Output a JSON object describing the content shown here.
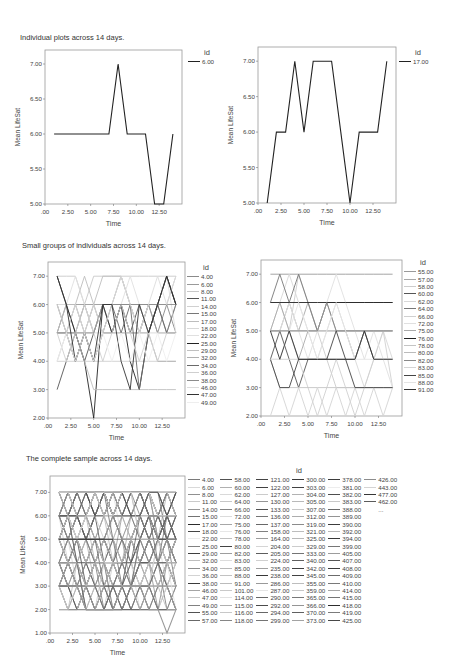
{
  "sections": {
    "individual_title": "Individual plots across 14 days.",
    "small_groups_title": "Small groups of individuals across 14 days.",
    "complete_title": "The complete sample across 14 days."
  },
  "legend_title": "id",
  "chart_data": [
    {
      "type": "line",
      "title": "Individual plots across 14 days.",
      "xlabel": "Time",
      "ylabel": "Mean LifeSat",
      "xlim": [
        0,
        15
      ],
      "ylim": [
        5,
        7.2
      ],
      "xticks": [
        ".00",
        "2.50",
        "5.00",
        "7.50",
        "10.00",
        "12.50"
      ],
      "yticks": [
        "5.00",
        "5.50",
        "6.00",
        "6.50",
        "7.00"
      ],
      "legend_title": "id",
      "legend_position": "right",
      "x": [
        1,
        2,
        3,
        4,
        5,
        6,
        7,
        8,
        9,
        10,
        11,
        12,
        13,
        14
      ],
      "series": [
        {
          "name": "6.00",
          "color": "#222222",
          "values": [
            6,
            6,
            6,
            6,
            6,
            6,
            6,
            7,
            6,
            6,
            6,
            5,
            5,
            6
          ]
        }
      ]
    },
    {
      "type": "line",
      "xlabel": "Time",
      "ylabel": "Mean LifeSat",
      "xlim": [
        0,
        15
      ],
      "ylim": [
        5,
        7.2
      ],
      "xticks": [
        ".00",
        "2.50",
        "5.00",
        "7.50",
        "10.00",
        "12.50"
      ],
      "yticks": [
        "5.00",
        "5.50",
        "6.00",
        "6.50",
        "7.00"
      ],
      "legend_title": "id",
      "legend_position": "right",
      "x": [
        1,
        2,
        3,
        4,
        5,
        6,
        7,
        8,
        9,
        10,
        11,
        12,
        13,
        14
      ],
      "series": [
        {
          "name": "17.00",
          "color": "#222222",
          "values": [
            5,
            6,
            6,
            7,
            6,
            7,
            7,
            7,
            6,
            5,
            6,
            6,
            6,
            7
          ]
        }
      ]
    },
    {
      "type": "line",
      "title": "Small groups of individuals across 14 days.",
      "xlabel": "Time",
      "ylabel": "Mean LifeSat",
      "xlim": [
        0,
        15
      ],
      "ylim": [
        2,
        7.5
      ],
      "xticks": [
        ".00",
        "2.50",
        "5.00",
        "7.50",
        "10.00",
        "12.50"
      ],
      "yticks": [
        "2.00",
        "3.00",
        "4.00",
        "5.00",
        "6.00",
        "7.00"
      ],
      "legend_title": "id",
      "legend_position": "right",
      "x": [
        1,
        2,
        3,
        4,
        5,
        6,
        7,
        8,
        9,
        10,
        11,
        12,
        13,
        14
      ],
      "series": [
        {
          "name": "4.00",
          "color": "#8a8a8a",
          "values": [
            5,
            5,
            6,
            5,
            6,
            5,
            5,
            6,
            5,
            5,
            6,
            5,
            6,
            5
          ]
        },
        {
          "name": "6.00",
          "color": "#9a9a9a",
          "values": [
            6,
            6,
            6,
            6,
            6,
            6,
            6,
            7,
            6,
            6,
            6,
            5,
            5,
            6
          ]
        },
        {
          "name": "8.00",
          "color": "#c8c8c8",
          "values": [
            7,
            7,
            7,
            6,
            7,
            7,
            7,
            7,
            7,
            7,
            7,
            7,
            7,
            7
          ]
        },
        {
          "name": "11.00",
          "color": "#555555",
          "values": [
            3,
            4,
            5,
            4,
            5,
            6,
            5,
            6,
            5,
            6,
            5,
            6,
            7,
            6
          ]
        },
        {
          "name": "14.00",
          "color": "#d0d0d0",
          "values": [
            4,
            4,
            4,
            4,
            4,
            4,
            4,
            4,
            4,
            4,
            4,
            4,
            4,
            4
          ]
        },
        {
          "name": "15.00",
          "color": "#777777",
          "values": [
            5,
            6,
            5,
            6,
            5,
            6,
            6,
            6,
            6,
            5,
            6,
            6,
            5,
            6
          ]
        },
        {
          "name": "17.00",
          "color": "#bdbdbd",
          "values": [
            5,
            6,
            6,
            7,
            6,
            7,
            7,
            7,
            6,
            5,
            6,
            6,
            6,
            7
          ]
        },
        {
          "name": "18.00",
          "color": "#d8d8d8",
          "values": [
            5,
            5,
            5,
            5,
            5,
            5,
            5,
            5,
            5,
            5,
            5,
            5,
            5,
            5
          ]
        },
        {
          "name": "22.00",
          "color": "#e0e0e0",
          "values": [
            6,
            6,
            7,
            6,
            5,
            6,
            5,
            6,
            7,
            6,
            5,
            6,
            7,
            5
          ]
        },
        {
          "name": "25.00",
          "color": "#222222",
          "values": [
            7,
            6,
            5,
            4,
            2,
            6,
            5,
            6,
            4,
            3,
            5,
            6,
            7,
            6
          ]
        },
        {
          "name": "29.00",
          "color": "#c0c0c0",
          "values": [
            4,
            5,
            5,
            4,
            3,
            3,
            3,
            3,
            3,
            3,
            3,
            3,
            3,
            3
          ]
        },
        {
          "name": "32.00",
          "color": "#b0b0b0",
          "values": [
            5,
            5,
            4,
            5,
            4,
            5,
            5,
            5,
            5,
            5,
            5,
            4,
            4,
            4
          ]
        },
        {
          "name": "34.00",
          "color": "#6a6a6a",
          "values": [
            6,
            5,
            4,
            5,
            4,
            5,
            6,
            5,
            6,
            3,
            5,
            6,
            5,
            5
          ]
        },
        {
          "name": "36.00",
          "color": "#cfcfcf",
          "values": [
            5,
            4,
            5,
            6,
            5,
            4,
            5,
            6,
            5,
            4,
            5,
            4,
            5,
            5
          ]
        },
        {
          "name": "38.00",
          "color": "#8c8c8c",
          "values": [
            5,
            5,
            5,
            5,
            5,
            6,
            6,
            6,
            6,
            6,
            6,
            6,
            6,
            6
          ]
        },
        {
          "name": "46.00",
          "color": "#dcdcdc",
          "values": [
            6,
            5,
            6,
            5,
            6,
            5,
            6,
            7,
            6,
            5,
            6,
            7,
            6,
            7
          ]
        },
        {
          "name": "47.00",
          "color": "#333333",
          "values": [
            7,
            6,
            4,
            5,
            4,
            6,
            6,
            4,
            3,
            6,
            5,
            6,
            7,
            6
          ]
        },
        {
          "name": "49.00",
          "color": "#eeeeee",
          "values": [
            4,
            5,
            4,
            5,
            4,
            5,
            4,
            5,
            4,
            5,
            4,
            5,
            4,
            5
          ]
        }
      ]
    },
    {
      "type": "line",
      "xlabel": "Time",
      "ylabel": "Mean LifeSat",
      "xlim": [
        0,
        15
      ],
      "ylim": [
        2,
        7.5
      ],
      "xticks": [
        ".00",
        "2.50",
        "5.00",
        "7.50",
        "10.00",
        "12.50"
      ],
      "yticks": [
        "2.00",
        "3.00",
        "4.00",
        "5.00",
        "6.00",
        "7.00"
      ],
      "legend_title": "id",
      "legend_position": "right",
      "x": [
        1,
        2,
        3,
        4,
        5,
        6,
        7,
        8,
        9,
        10,
        11,
        12,
        13,
        14
      ],
      "series": [
        {
          "name": "55.00",
          "color": "#9a9a9a",
          "values": [
            7,
            7,
            7,
            7,
            7,
            7,
            7,
            7,
            7,
            7,
            7,
            7,
            7,
            7
          ]
        },
        {
          "name": "57.00",
          "color": "#a8a8a8",
          "values": [
            5,
            5,
            6,
            5,
            6,
            5,
            5,
            5,
            5,
            5,
            5,
            5,
            5,
            5
          ]
        },
        {
          "name": "58.00",
          "color": "#cccccc",
          "values": [
            6,
            6,
            5,
            7,
            6,
            5,
            4,
            3,
            3,
            3,
            3,
            3,
            3,
            3
          ]
        },
        {
          "name": "60.00",
          "color": "#555555",
          "values": [
            4,
            5,
            4,
            3,
            4,
            4,
            4,
            4,
            4,
            4,
            5,
            4,
            4,
            4
          ]
        },
        {
          "name": "62.00",
          "color": "#d8d8d8",
          "values": [
            5,
            6,
            7,
            6,
            5,
            4,
            5,
            6,
            5,
            4,
            3,
            4,
            5,
            4
          ]
        },
        {
          "name": "64.00",
          "color": "#777777",
          "values": [
            6,
            7,
            6,
            7,
            6,
            5,
            6,
            6,
            6,
            6,
            6,
            6,
            6,
            6
          ]
        },
        {
          "name": "66.00",
          "color": "#d0d0d0",
          "values": [
            4,
            4,
            4,
            4,
            3,
            2,
            3,
            4,
            3,
            2,
            3,
            4,
            5,
            3
          ]
        },
        {
          "name": "72.00",
          "color": "#e0e0e0",
          "values": [
            5,
            5,
            6,
            5,
            4,
            5,
            6,
            7,
            6,
            5,
            4,
            5,
            4,
            3
          ]
        },
        {
          "name": "75.00",
          "color": "#aaaaaa",
          "values": [
            5,
            6,
            5,
            4,
            5,
            5,
            6,
            5,
            5,
            5,
            5,
            5,
            5,
            5
          ]
        },
        {
          "name": "76.00",
          "color": "#222222",
          "values": [
            6,
            6,
            6,
            6,
            6,
            6,
            6,
            6,
            6,
            6,
            6,
            6,
            6,
            6
          ]
        },
        {
          "name": "78.00",
          "color": "#c4c4c4",
          "values": [
            4,
            3,
            3,
            3,
            3,
            3,
            3,
            3,
            3,
            3,
            3,
            3,
            3,
            3
          ]
        },
        {
          "name": "80.00",
          "color": "#bbbbbb",
          "values": [
            5,
            5,
            5,
            5,
            5,
            5,
            5,
            5,
            5,
            4,
            5,
            5,
            5,
            5
          ]
        },
        {
          "name": "82.00",
          "color": "#888888",
          "values": [
            5,
            5,
            5,
            5,
            5,
            5,
            6,
            5,
            5,
            5,
            5,
            5,
            5,
            5
          ]
        },
        {
          "name": "83.00",
          "color": "#d4d4d4",
          "values": [
            2,
            3,
            2,
            3,
            2,
            3,
            2,
            3,
            2,
            3,
            2,
            3,
            2,
            3
          ]
        },
        {
          "name": "85.00",
          "color": "#444444",
          "values": [
            4,
            3,
            3,
            4,
            4,
            4,
            4,
            5,
            4,
            3,
            3,
            3,
            3,
            3
          ]
        },
        {
          "name": "88.00",
          "color": "#e4e4e4",
          "values": [
            4,
            4,
            5,
            6,
            5,
            4,
            5,
            6,
            5,
            4,
            4,
            4,
            4,
            4
          ]
        },
        {
          "name": "91.00",
          "color": "#333333",
          "values": [
            5,
            4,
            5,
            4,
            4,
            4,
            4,
            4,
            4,
            4,
            5,
            4,
            4,
            4
          ]
        }
      ]
    },
    {
      "type": "line",
      "title": "The complete sample across 14 days.",
      "xlabel": "Time",
      "ylabel": "Mean LifeSat",
      "xlim": [
        0,
        15
      ],
      "ylim": [
        1,
        7.7
      ],
      "xticks": [
        ".00",
        "2.50",
        "5.00",
        "7.50",
        "10.00",
        "12.50"
      ],
      "yticks": [
        "1.00",
        "2.00",
        "3.00",
        "4.00",
        "5.00",
        "6.00",
        "7.00"
      ],
      "legend_title": "id",
      "legend_position": "right",
      "x": [
        1,
        2,
        3,
        4,
        5,
        6,
        7,
        8,
        9,
        10,
        11,
        12,
        13,
        14
      ],
      "series_note": "Dense overlay of all ids listed in legend_columns; lines generated procedurally in gray shades",
      "legend_columns": [
        [
          "4.00",
          "6.00",
          "8.00",
          "11.00",
          "14.00",
          "15.00",
          "17.00",
          "18.00",
          "22.00",
          "25.00",
          "29.00",
          "32.00",
          "34.00",
          "36.00",
          "38.00",
          "46.00",
          "47.00",
          "49.00",
          "55.00",
          "57.00"
        ],
        [
          "58.00",
          "60.00",
          "62.00",
          "64.00",
          "66.00",
          "72.00",
          "75.00",
          "76.00",
          "78.00",
          "80.00",
          "82.00",
          "83.00",
          "85.00",
          "88.00",
          "91.00",
          "101.00",
          "114.00",
          "115.00",
          "116.00",
          "118.00"
        ],
        [
          "121.00",
          "122.00",
          "127.00",
          "130.00",
          "133.00",
          "136.00",
          "137.00",
          "158.00",
          "164.00",
          "204.00",
          "205.00",
          "224.00",
          "235.00",
          "238.00",
          "286.00",
          "287.00",
          "290.00",
          "292.00",
          "294.00",
          "299.00"
        ],
        [
          "300.00",
          "303.00",
          "304.00",
          "305.00",
          "307.00",
          "312.00",
          "319.00",
          "321.00",
          "325.00",
          "329.00",
          "333.00",
          "340.00",
          "342.00",
          "345.00",
          "355.00",
          "359.00",
          "365.00",
          "366.00",
          "370.00",
          "373.00"
        ],
        [
          "378.00",
          "381.00",
          "382.00",
          "383.00",
          "388.00",
          "389.00",
          "390.00",
          "392.00",
          "394.00",
          "399.00",
          "405.00",
          "407.00",
          "408.00",
          "409.00",
          "410.00",
          "414.00",
          "415.00",
          "418.00",
          "419.00",
          "425.00"
        ],
        [
          "426.00",
          "443.00",
          "477.00",
          "462.00",
          "..."
        ]
      ],
      "highlighted_series": [
        {
          "name": "low-trajectory",
          "color": "#9a9a9a",
          "values": [
            4,
            3,
            3,
            2,
            2,
            2,
            2,
            3,
            3,
            3,
            2,
            2,
            1,
            2
          ]
        },
        {
          "name": "flat-5",
          "color": "#333333",
          "values": [
            5,
            5,
            5,
            5,
            5,
            5,
            5,
            null,
            null,
            null,
            null,
            null,
            null,
            null
          ]
        }
      ]
    }
  ]
}
